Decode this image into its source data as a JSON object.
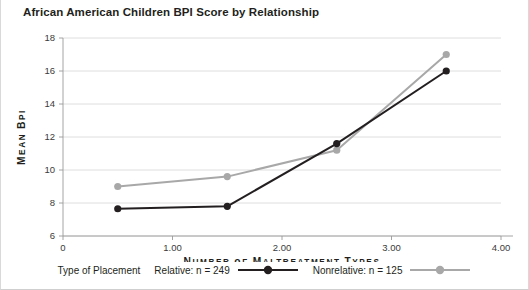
{
  "chart_data": {
    "type": "line",
    "title": "African American Children BPI Score by Relationship",
    "xlabel": "Number of Maltreatment Types",
    "ylabel": "Mean BPI",
    "xlim": [
      0,
      4
    ],
    "ylim": [
      6,
      18
    ],
    "x_ticks": [
      "0",
      "1.00",
      "2.00",
      "3.00",
      "4.00"
    ],
    "x_tick_values": [
      0,
      1,
      2,
      3,
      4
    ],
    "y_ticks": [
      "6",
      "8",
      "10",
      "12",
      "14",
      "16",
      "18"
    ],
    "y_tick_values": [
      6,
      8,
      10,
      12,
      14,
      16,
      18
    ],
    "grid": true,
    "legend_position": "bottom",
    "legend_title": "Type of Placement",
    "x": [
      0.5,
      1.5,
      2.5,
      3.5
    ],
    "series": [
      {
        "name": "Relative: n = 249",
        "color": "#231f20",
        "marker": "circle",
        "values": [
          7.65,
          7.8,
          11.6,
          16.0
        ]
      },
      {
        "name": "Nonrelative: n = 125",
        "color": "#a8a8a8",
        "marker": "circle",
        "values": [
          9.0,
          9.6,
          11.2,
          17.0
        ]
      }
    ]
  },
  "legend": {
    "title": "Type of Placement",
    "entries": [
      {
        "label": "Relative: n = 249",
        "color": "#231f20"
      },
      {
        "label": "Nonrelative: n = 125",
        "color": "#a8a8a8"
      }
    ]
  }
}
